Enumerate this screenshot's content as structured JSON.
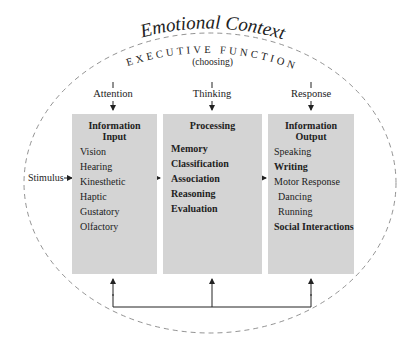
{
  "title": "Emotional Context",
  "subtitle": "EXECUTIVE FUNCTION",
  "subtitle_note": "(choosing)",
  "stimulus_label": "Stimulus",
  "columns": [
    {
      "header": "Attention",
      "box_title_line1": "Information",
      "box_title_line2": "Input",
      "items": [
        {
          "label": "Vision",
          "bold": false
        },
        {
          "label": "Hearing",
          "bold": false
        },
        {
          "label": "Kinesthetic",
          "bold": false
        },
        {
          "label": "Haptic",
          "bold": false
        },
        {
          "label": "Gustatory",
          "bold": false
        },
        {
          "label": "Olfactory",
          "bold": false
        }
      ]
    },
    {
      "header": "Thinking",
      "box_title_line1": "Processing",
      "box_title_line2": "",
      "items": [
        {
          "label": "Memory",
          "bold": true
        },
        {
          "label": "Classification",
          "bold": true
        },
        {
          "label": "Association",
          "bold": true
        },
        {
          "label": "Reasoning",
          "bold": true
        },
        {
          "label": "Evaluation",
          "bold": true
        }
      ]
    },
    {
      "header": "Response",
      "box_title_line1": "Information",
      "box_title_line2": "Output",
      "items": [
        {
          "label": "Speaking",
          "bold": false
        },
        {
          "label": "Writing",
          "bold": true
        },
        {
          "label": "Motor Response",
          "bold": false
        },
        {
          "label": "Dancing",
          "bold": false
        },
        {
          "label": "Running",
          "bold": false
        },
        {
          "label": "Social Interactions",
          "bold": true
        }
      ]
    }
  ],
  "colors": {
    "box_fill": "#d4d4d4",
    "line": "#222222",
    "dash": "#777777"
  }
}
